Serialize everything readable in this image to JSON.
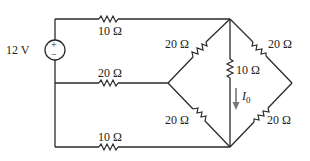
{
  "diagram": {
    "type": "circuit-schematic",
    "source": {
      "label": "12 V",
      "polarity_top": "+",
      "polarity_bottom": "−"
    },
    "resistors": {
      "top_left": "10 Ω",
      "middle_left": "20 Ω",
      "bottom_left": "10 Ω",
      "diamond_upper_left": "20 Ω",
      "diamond_upper_right": "20 Ω",
      "diamond_lower_left": "20 Ω",
      "diamond_lower_right": "20 Ω",
      "center_vertical": "10 Ω"
    },
    "current": {
      "label": "I",
      "subscript": "0",
      "direction": "down"
    }
  }
}
